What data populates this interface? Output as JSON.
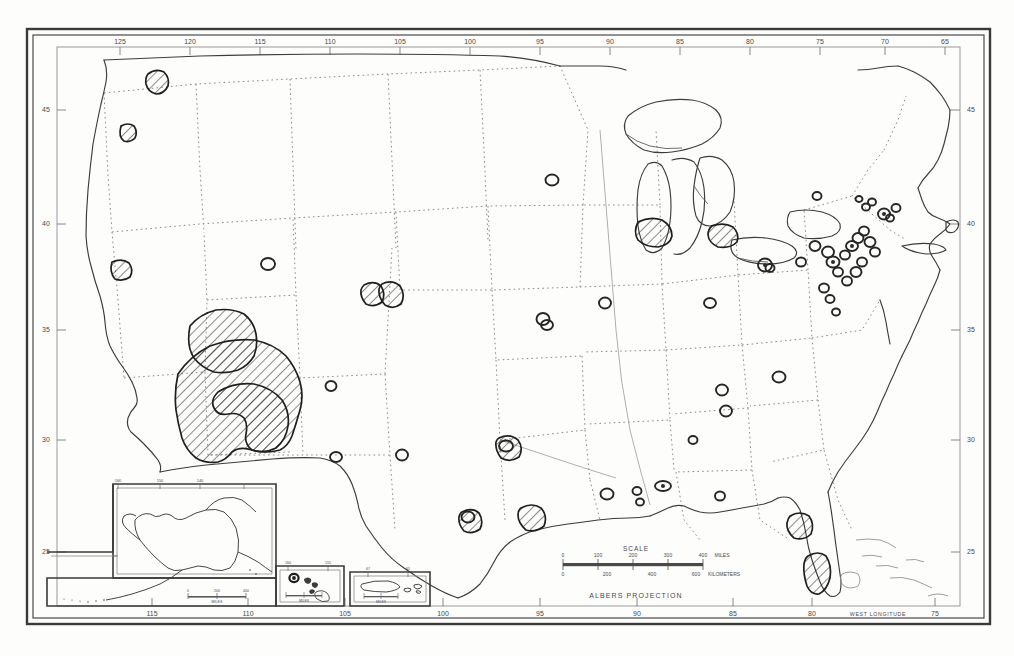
{
  "document": {
    "type": "map",
    "title": "United States Distribution Map",
    "projection_label": "ALBERS PROJECTION",
    "longitude_axis_label": "WEST LONGITUDE"
  },
  "frame": {
    "border_color": "#3a3a3a",
    "background_color": "#fdfdfc",
    "ink_color": "#2b2b2b",
    "boundary_color": "#777777",
    "tick_label_color": "#4a4a4a"
  },
  "graticule": {
    "longitude_top_ticks": [
      "125",
      "120",
      "115",
      "110",
      "105",
      "100",
      "95",
      "90",
      "85",
      "80",
      "75",
      "70",
      "65"
    ],
    "longitude_bottom_ticks": [
      "115",
      "110",
      "105",
      "100",
      "95",
      "90",
      "85",
      "80",
      "75"
    ],
    "latitude_left_ticks": [
      "45",
      "40",
      "35",
      "30",
      "25"
    ],
    "latitude_right_ticks": [
      "45",
      "40",
      "35",
      "30",
      "25"
    ]
  },
  "scale_bar": {
    "title": "SCALE",
    "miles_ticks": [
      "0",
      "100",
      "200",
      "300",
      "400"
    ],
    "miles_unit": "MILES",
    "kilometers_ticks": [
      "0",
      "200",
      "400",
      "600"
    ],
    "kilometers_unit": "KILOMETERS"
  },
  "insets": [
    {
      "name": "alaska",
      "scale_unit": "MILES",
      "scale_ticks": [
        "0",
        "200",
        "400"
      ],
      "corner_ticks": [
        "160",
        "150",
        "140",
        "60",
        "55"
      ]
    },
    {
      "name": "hawaii",
      "scale_unit": "MILES",
      "scale_ticks": [
        "0",
        "100",
        "200"
      ],
      "corner_ticks": [
        "160",
        "155"
      ]
    },
    {
      "name": "puerto-rico",
      "scale_unit": "MILES",
      "scale_ticks": [
        "0",
        "50",
        "100"
      ],
      "corner_ticks": [
        "67",
        "65"
      ]
    }
  ],
  "legend_note": "",
  "markers": {
    "hatched_region_count": 14,
    "point_marker_count": 46
  }
}
